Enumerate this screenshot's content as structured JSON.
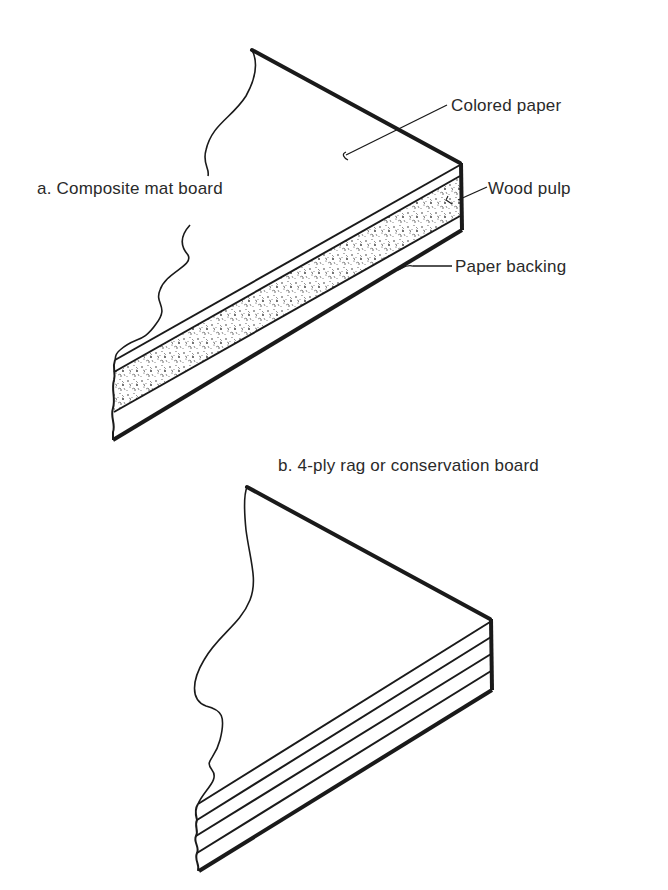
{
  "figure": {
    "panel_a": {
      "title": "a.  Composite mat board",
      "layers": [
        {
          "label": "Colored paper"
        },
        {
          "label": "Wood pulp"
        },
        {
          "label": "Paper backing"
        }
      ]
    },
    "panel_b": {
      "title": "b.  4-ply rag or conservation board",
      "ply_count": 4
    }
  },
  "colors": {
    "ink": "#1a1a1a",
    "background": "#ffffff"
  }
}
